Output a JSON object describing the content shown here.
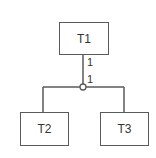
{
  "diagram": {
    "type": "hierarchy",
    "colors": {
      "stroke": "#5a5a5a",
      "text": "#333333",
      "background": "#ffffff"
    },
    "nodes": [
      {
        "id": "T1",
        "label": "T1"
      },
      {
        "id": "T2",
        "label": "T2"
      },
      {
        "id": "T3",
        "label": "T3"
      }
    ],
    "edges": [
      {
        "from": "T1",
        "to": "junction",
        "cardinality_source": "1",
        "cardinality_target": "1"
      },
      {
        "from": "junction",
        "to": "T2"
      },
      {
        "from": "junction",
        "to": "T3"
      }
    ],
    "junction": {
      "shape": "circle"
    }
  }
}
